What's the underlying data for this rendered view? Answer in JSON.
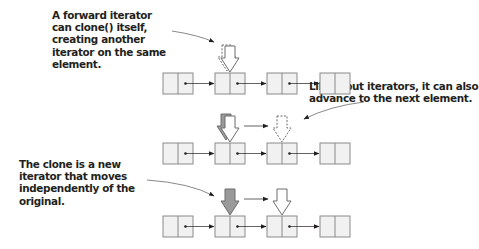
{
  "annotations": {
    "clone_note": "A forward iterator can clone() itself, creating another iterator on the same element.",
    "advance_note": "Like input iterators, it can also advance to the next element.",
    "independent_note": "The clone is a new iterator that moves independently of the original."
  },
  "diagram": {
    "rows": [
      {
        "id": "clone",
        "node_count": 4,
        "original_at": 1,
        "clone_at": 1
      },
      {
        "id": "advance",
        "node_count": 4,
        "original_at": 1,
        "clone_at": 1,
        "next_target": 2
      },
      {
        "id": "independent",
        "node_count": 4,
        "original_at": 1,
        "clone_at": 2
      }
    ],
    "colors": {
      "node_fill": "#f1f1f1",
      "node_stroke": "#8a8a8a",
      "arrow_gray": "#9a9a9a",
      "arrow_outline": "#6d6d6d",
      "text": "#231f20"
    }
  }
}
